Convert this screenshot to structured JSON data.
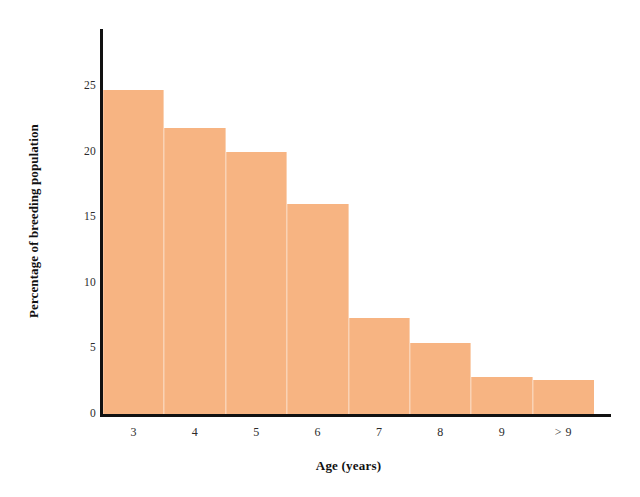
{
  "chart_data": {
    "type": "bar",
    "title": "",
    "subtitle": "",
    "xlabel": "Age (years)",
    "ylabel": "Percentage of breeding population",
    "categories": [
      "3",
      "4",
      "5",
      "6",
      "7",
      "8",
      "9",
      "> 9"
    ],
    "values": [
      24.7,
      21.8,
      20.0,
      16.0,
      7.3,
      5.4,
      2.8,
      2.6
    ],
    "series": [
      {
        "name": "Percentage of breeding population",
        "values": [
          24.7,
          21.8,
          20.0,
          16.0,
          7.3,
          5.4,
          2.8,
          2.6
        ]
      }
    ],
    "ylim": [
      0,
      29.3
    ],
    "yticks": [
      0,
      5,
      10,
      15,
      20,
      25
    ],
    "ytick_labels": [
      "0",
      "5",
      "10",
      "15",
      "20",
      "25"
    ],
    "grid": false,
    "legend": false,
    "legend_position": "none",
    "bar_gap": 0,
    "colors": {
      "bar_fill": "#f7b482",
      "axis": "#111111",
      "text": "#2b2b2b",
      "background": "#ffffff"
    }
  }
}
